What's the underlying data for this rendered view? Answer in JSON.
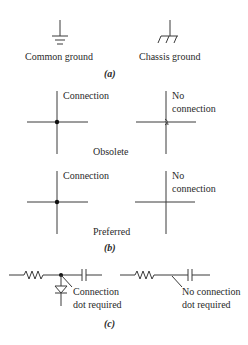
{
  "section_a": {
    "common_ground_label": "Common ground",
    "chassis_ground_label": "Chassis ground",
    "caption": "(a)"
  },
  "section_b": {
    "obsolete": {
      "connection_label": "Connection",
      "no_connection_label_line1": "No",
      "no_connection_label_line2": "connection",
      "style_label": "Obsolete"
    },
    "preferred": {
      "connection_label": "Connection",
      "no_connection_label_line1": "No",
      "no_connection_label_line2": "connection",
      "style_label": "Preferred"
    },
    "caption": "(b)"
  },
  "section_c": {
    "left_label_line1": "Connection",
    "left_label_line2": "dot required",
    "right_label_line1": "No connection",
    "right_label_line2": "dot required",
    "caption": "(c)"
  },
  "colors": {
    "line": "#3a3a3a",
    "dot": "#111111",
    "text": "#2a2a2a",
    "background": "#ffffff"
  }
}
